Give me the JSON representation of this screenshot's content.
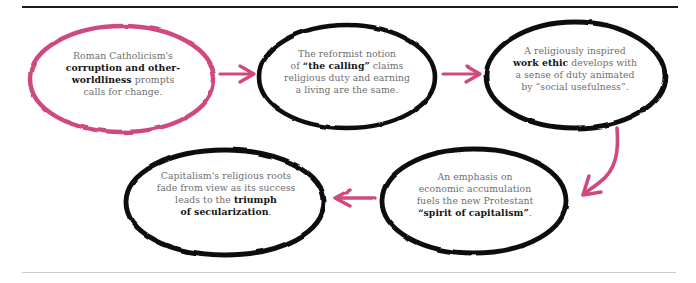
{
  "figure": {
    "type": "flowchart",
    "title": "",
    "orientation": "serpentine",
    "style": "hand-drawn",
    "colors": {
      "accent_pink": "#cf4a80",
      "node_stroke": "#101010",
      "body_text": "#6e6e6e",
      "bold_text": "#151515",
      "rule_top": "#1c1c1c",
      "rule_bottom": "#c9c9c9",
      "background": "#ffffff"
    }
  },
  "nodes": [
    {
      "id": "node-1",
      "order": 1,
      "stroke": "pink",
      "lines": [
        {
          "segments": [
            {
              "text": "Roman Catholicism's",
              "bold": false
            }
          ]
        },
        {
          "segments": [
            {
              "text": "corruption and other-",
              "bold": true
            }
          ]
        },
        {
          "segments": [
            {
              "text": "worldliness",
              "bold": true
            },
            {
              "text": " prompts",
              "bold": false
            }
          ]
        },
        {
          "segments": [
            {
              "text": "calls for change.",
              "bold": false
            }
          ]
        }
      ],
      "plain_text": "Roman Catholicism's corruption and other-worldliness prompts calls for change."
    },
    {
      "id": "node-2",
      "order": 2,
      "stroke": "black",
      "lines": [
        {
          "segments": [
            {
              "text": "The reformist notion",
              "bold": false
            }
          ]
        },
        {
          "segments": [
            {
              "text": "of ",
              "bold": false
            },
            {
              "text": "“the calling”",
              "bold": true
            },
            {
              "text": " claims",
              "bold": false
            }
          ]
        },
        {
          "segments": [
            {
              "text": "religious duty and earning",
              "bold": false
            }
          ]
        },
        {
          "segments": [
            {
              "text": "a living are the same.",
              "bold": false
            }
          ]
        }
      ],
      "plain_text": "The reformist notion of “the calling” claims religious duty and earning a living are the same."
    },
    {
      "id": "node-3",
      "order": 3,
      "stroke": "black",
      "lines": [
        {
          "segments": [
            {
              "text": "A religiously inspired",
              "bold": false
            }
          ]
        },
        {
          "segments": [
            {
              "text": "work ethic",
              "bold": true
            },
            {
              "text": " develops with",
              "bold": false
            }
          ]
        },
        {
          "segments": [
            {
              "text": "a sense of duty animated",
              "bold": false
            }
          ]
        },
        {
          "segments": [
            {
              "text": "by “social usefulness”.",
              "bold": false
            }
          ]
        }
      ],
      "plain_text": "A religiously inspired work ethic develops with a sense of duty animated by “social usefulness”."
    },
    {
      "id": "node-4",
      "order": 4,
      "stroke": "black",
      "lines": [
        {
          "segments": [
            {
              "text": "An emphasis on",
              "bold": false
            }
          ]
        },
        {
          "segments": [
            {
              "text": "economic accumulation",
              "bold": false
            }
          ]
        },
        {
          "segments": [
            {
              "text": "fuels the new Protestant",
              "bold": false
            }
          ]
        },
        {
          "segments": [
            {
              "text": "“spirit of capitalism”",
              "bold": true
            },
            {
              "text": ".",
              "bold": false
            }
          ]
        }
      ],
      "plain_text": "An emphasis on economic accumulation fuels the new Protestant “spirit of capitalism”."
    },
    {
      "id": "node-5",
      "order": 5,
      "stroke": "black",
      "lines": [
        {
          "segments": [
            {
              "text": "Capitalism's religious roots",
              "bold": false
            }
          ]
        },
        {
          "segments": [
            {
              "text": "fade from view as its success",
              "bold": false
            }
          ]
        },
        {
          "segments": [
            {
              "text": "leads to the ",
              "bold": false
            },
            {
              "text": "triumph",
              "bold": true
            }
          ]
        },
        {
          "segments": [
            {
              "text": "of secularization",
              "bold": true
            },
            {
              "text": ".",
              "bold": false
            }
          ]
        }
      ],
      "plain_text": "Capitalism's religious roots fade from view as its success leads to the triumph of secularization."
    }
  ],
  "connectors": [
    {
      "id": "arrow-1-2",
      "from": "node-1",
      "to": "node-2",
      "direction": "right",
      "shape": "straight",
      "color": "#cf4a80"
    },
    {
      "id": "arrow-2-3",
      "from": "node-2",
      "to": "node-3",
      "direction": "right",
      "shape": "straight",
      "color": "#cf4a80"
    },
    {
      "id": "arrow-3-4",
      "from": "node-3",
      "to": "node-4",
      "direction": "down-left",
      "shape": "curved",
      "color": "#cf4a80"
    },
    {
      "id": "arrow-4-5",
      "from": "node-4",
      "to": "node-5",
      "direction": "left",
      "shape": "straight",
      "color": "#cf4a80"
    }
  ]
}
